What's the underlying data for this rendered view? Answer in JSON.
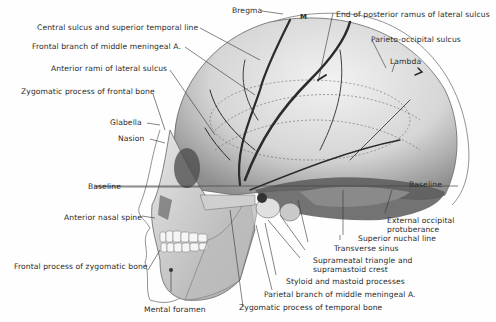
{
  "figure": {
    "labels": {
      "bregma": "Bregma",
      "m_marker": "M",
      "end_posterior_ramus": "End of posterior ramus of lateral sulcus",
      "central_sulcus": "Central sulcus and superior temporal line",
      "frontal_branch": "Frontal branch of middle meningeal A.",
      "parieto_occipital": "Parieto-occipital sulcus",
      "lambda": "Lambda",
      "anterior_rami": "Anterior rami of lateral sulcus",
      "zygomatic_process_frontal": "Zygomatic process of frontal bone",
      "glabella": "Glabella",
      "nasion": "Nasion",
      "baseline_left": "Baseline",
      "baseline_right": "Baseline",
      "anterior_nasal_spine": "Anterior nasal spine",
      "external_occipital_1": "External occipital",
      "external_occipital_2": "protuberance",
      "superior_nuchal": "Superior nuchal line",
      "transverse_sinus": "Transverse sinus",
      "suprameatal_1": "Suprameatal triangle and",
      "suprameatal_2": "supramastoid crest",
      "frontal_process_zygomatic": "Frontal process of zygomatic bone",
      "styloid_mastoid": "Styloid and mastoid processes",
      "parietal_branch": "Parietal branch of middle meningeal A.",
      "mental_foramen": "Mental foramen",
      "zygomatic_process_temporal": "Zygomatic process of temporal bone"
    },
    "colors": {
      "bone": "#d8d8d8",
      "bone_shadow": "#9a9a9a",
      "vessel": "#2b2b2b",
      "leader": "#333333",
      "text": "#2a2a2a"
    }
  }
}
